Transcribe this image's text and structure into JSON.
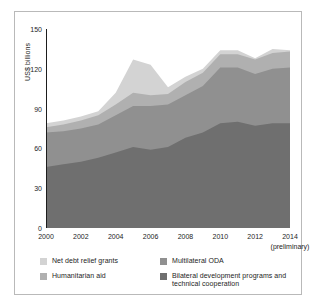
{
  "chart_data": {
    "type": "area",
    "stacked": true,
    "title": "",
    "xlabel": "",
    "ylabel": "US$ billions",
    "x": [
      2000,
      2001,
      2002,
      2003,
      2004,
      2005,
      2006,
      2007,
      2008,
      2009,
      2010,
      2011,
      2012,
      2013,
      2014
    ],
    "xlim": [
      2000,
      2014
    ],
    "ylim": [
      0,
      150
    ],
    "ytick_labels": [
      "0",
      "30",
      "60",
      "90",
      "120",
      "150"
    ],
    "yticks": [
      0,
      30,
      60,
      90,
      120,
      150
    ],
    "xtick_labels": [
      "2000",
      "2002",
      "2004",
      "2006",
      "2008",
      "2010",
      "2012",
      "2014"
    ],
    "xticks": [
      2000,
      2002,
      2004,
      2006,
      2008,
      2010,
      2012,
      2014
    ],
    "xtick_minor": [
      2001,
      2003,
      2005,
      2007,
      2009,
      2011,
      2013
    ],
    "axis_note": "(preliminary)",
    "axis_note_at": 2014,
    "grid": false,
    "legend_position": "below",
    "series": [
      {
        "name": "Bilateral development programs and technical cooperation",
        "color": "#6f6f6f",
        "values": [
          46,
          48,
          50,
          53,
          57,
          61,
          59,
          61,
          68,
          72,
          79,
          80,
          77,
          79,
          79
        ]
      },
      {
        "name": "Multilateral ODA",
        "color": "#909090",
        "values": [
          26,
          25,
          25,
          25,
          28,
          31,
          33,
          32,
          32,
          35,
          42,
          41,
          39,
          41,
          42
        ]
      },
      {
        "name": "Humanitarian aid",
        "color": "#b0b0b0",
        "values": [
          4,
          5,
          6,
          7,
          8,
          10,
          8,
          8,
          10,
          10,
          10,
          10,
          11,
          12,
          12
        ]
      },
      {
        "name": "Net debt relief grants",
        "color": "#d3d3d3",
        "values": [
          3,
          3,
          3,
          3,
          9,
          25,
          23,
          5,
          4,
          3,
          3,
          3,
          1,
          3,
          1
        ]
      }
    ],
    "totals": [
      79,
      81,
      84,
      88,
      102,
      127,
      123,
      106,
      114,
      120,
      134,
      134,
      128,
      135,
      134
    ]
  },
  "legend": {
    "items": [
      {
        "label": "Net debt relief grants",
        "color": "#d3d3d3",
        "column": "left"
      },
      {
        "label": "Humanitarian aid",
        "color": "#b0b0b0",
        "column": "left"
      },
      {
        "label": "Multilateral ODA",
        "color": "#909090",
        "column": "right"
      },
      {
        "label": "Bilateral development programs and technical cooperation",
        "color": "#6f6f6f",
        "column": "right"
      }
    ]
  },
  "colors": {
    "axis": "#1d1d1d",
    "frame": "#b9b9b9",
    "background": "#ffffff"
  }
}
